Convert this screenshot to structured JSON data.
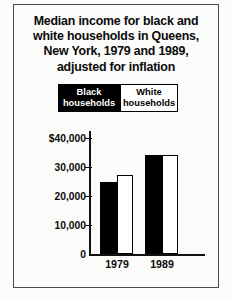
{
  "chart_data": {
    "type": "bar",
    "title": "Median income for black and white households in Queens, New York, 1979 and 1989, adjusted for inflation",
    "title_lines": [
      "Median income for black and",
      "white households in Queens,",
      "New York, 1979 and 1989,",
      "adjusted for inflation"
    ],
    "categories": [
      "1979",
      "1989"
    ],
    "series": [
      {
        "name": "Black households",
        "values": [
          25000,
          34000
        ],
        "color": "#000000"
      },
      {
        "name": "White households",
        "values": [
          27200,
          34000
        ],
        "color": "#ffffff"
      }
    ],
    "xlabel": "",
    "ylabel": "",
    "ylim": [
      0,
      40000
    ],
    "ytick_values": [
      40000,
      30000,
      20000,
      10000,
      0
    ],
    "ytick_labels": [
      "$40,000",
      "30,000",
      "20,000",
      "10,000",
      "0"
    ],
    "grid": false,
    "legend_position": "top"
  },
  "legend": {
    "items": [
      {
        "line1": "Black",
        "line2": "households"
      },
      {
        "line1": "White",
        "line2": "households"
      }
    ]
  },
  "colors": {
    "paper": "#fbfbf9",
    "ink": "#0a0a0a",
    "frame": "#4a4a4a",
    "black_bar": "#000000",
    "white_bar": "#ffffff"
  }
}
